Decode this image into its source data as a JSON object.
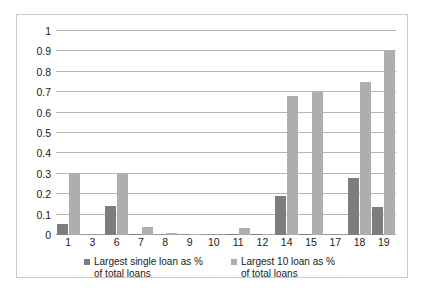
{
  "chart_data": {
    "type": "bar",
    "title": "",
    "xlabel": "",
    "ylabel": "",
    "ylim": [
      0,
      1
    ],
    "yticks": [
      0,
      0.1,
      0.2,
      0.3,
      0.4,
      0.5,
      0.6,
      0.7,
      0.8,
      0.9,
      1
    ],
    "ytick_labels": [
      "0",
      "0.1",
      "0.2",
      "0.3",
      "0.4",
      "0.5",
      "0.6",
      "0.7",
      "0.8",
      "0.9",
      "1"
    ],
    "grid": true,
    "legend_position": "bottom",
    "categories": [
      "1",
      "3",
      "6",
      "7",
      "8",
      "9",
      "10",
      "11",
      "12",
      "14",
      "15",
      "17",
      "18",
      "19"
    ],
    "series": [
      {
        "name": "Largest single loan as %\nof total loans",
        "color": "#7d7d7d",
        "values": [
          0.055,
          0,
          0.14,
          0.005,
          0,
          0,
          0,
          0.005,
          0.003,
          0.19,
          0.007,
          0,
          0.28,
          0.135
        ]
      },
      {
        "name": "Largest 10 loan as %\nof total loans",
        "color": "#aeaeae",
        "values": [
          0.305,
          0,
          0.3,
          0.04,
          0.01,
          0.006,
          0,
          0.035,
          0.005,
          0.68,
          0.7,
          0,
          0.75,
          0.905
        ]
      }
    ]
  },
  "colors": {
    "series_1": "#7d7d7d",
    "series_2": "#aeaeae",
    "gridline": "#b5b5b5",
    "border": "#c9c9c9",
    "text": "#1a1a1a",
    "background": "#ffffff"
  }
}
